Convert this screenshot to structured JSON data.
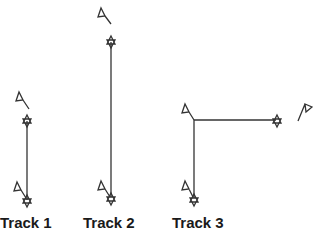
{
  "diagram": {
    "tracks": [
      {
        "label": "Track 1",
        "label_x": 0,
        "start_flag": [
          22,
          93
        ],
        "star_top": [
          27,
          121
        ],
        "star_bottom": [
          27,
          200
        ],
        "flag_bottom": [
          18,
          186
        ]
      },
      {
        "label": "Track 2",
        "label_x": 83,
        "start_flag": [
          103,
          14
        ],
        "star_top": [
          111,
          42
        ],
        "star_bottom": [
          111,
          197
        ],
        "flag_bottom": [
          102,
          183
        ]
      },
      {
        "label": "Track 3",
        "label_x": 172,
        "corner": [
          194,
          120
        ],
        "star_right": [
          276,
          120
        ],
        "star_bottom": [
          194,
          198
        ],
        "flag_bottom": [
          186,
          184
        ],
        "flag_top": [
          186,
          106
        ],
        "flag_right": [
          302,
          104
        ]
      }
    ],
    "stroke_color": "#333333"
  }
}
